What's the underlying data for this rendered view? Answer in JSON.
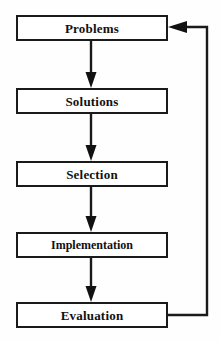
{
  "diagram": {
    "type": "flowchart",
    "background_color": "#fefefe",
    "stroke_color": "#1a1a1a",
    "text_color": "#111111",
    "nodes": [
      {
        "id": "problems",
        "label": "Problems",
        "x": 16,
        "y": 15,
        "width": 152,
        "height": 26
      },
      {
        "id": "solutions",
        "label": "Solutions",
        "x": 16,
        "y": 88,
        "width": 152,
        "height": 26
      },
      {
        "id": "selection",
        "label": "Selection",
        "x": 16,
        "y": 161,
        "width": 152,
        "height": 26
      },
      {
        "id": "implementation",
        "label": "Implementation",
        "x": 16,
        "y": 232,
        "width": 152,
        "height": 26
      },
      {
        "id": "evaluation",
        "label": "Evaluation",
        "x": 16,
        "y": 302,
        "width": 152,
        "height": 26
      }
    ],
    "edges": [
      {
        "id": "edge-problems-solutions",
        "from": "problems",
        "to": "solutions",
        "kind": "straight-down",
        "arrow": "down"
      },
      {
        "id": "edge-solutions-selection",
        "from": "solutions",
        "to": "selection",
        "kind": "straight-down",
        "arrow": "down"
      },
      {
        "id": "edge-selection-implementation",
        "from": "selection",
        "to": "implementation",
        "kind": "straight-down",
        "arrow": "down"
      },
      {
        "id": "edge-implementation-evaluation",
        "from": "implementation",
        "to": "evaluation",
        "kind": "straight-down",
        "arrow": "down"
      },
      {
        "id": "edge-evaluation-problems-feedback",
        "from": "evaluation",
        "to": "problems",
        "kind": "feedback-loop",
        "arrow": "left"
      }
    ]
  }
}
